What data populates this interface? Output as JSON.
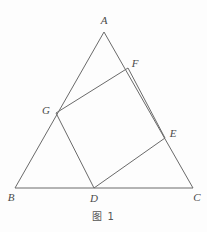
{
  "figure": {
    "caption": "图 1",
    "stroke_color": "#6a6a6a",
    "label_color": "#4a4a4a",
    "background_color": "#fdfdfd",
    "stroke_width": 1,
    "width": 207,
    "height": 232
  },
  "points": {
    "A": {
      "label": "A",
      "x": 104,
      "y": 32,
      "label_x": 104,
      "label_y": 20
    },
    "B": {
      "label": "B",
      "x": 15,
      "y": 188,
      "label_x": 11,
      "label_y": 197
    },
    "C": {
      "label": "C",
      "x": 193,
      "y": 188,
      "label_x": 197,
      "label_y": 197
    },
    "D": {
      "label": "D",
      "x": 94,
      "y": 188,
      "label_x": 94,
      "label_y": 198
    },
    "E": {
      "label": "E",
      "x": 165,
      "y": 138,
      "label_x": 173,
      "label_y": 133
    },
    "F": {
      "label": "F",
      "x": 128,
      "y": 68,
      "label_x": 135,
      "label_y": 63
    },
    "G": {
      "label": "G",
      "x": 56,
      "y": 113,
      "label_x": 46,
      "label_y": 110
    }
  },
  "shapes": {
    "triangle": {
      "name": "triangle-ABC",
      "vertices": "A,B,C",
      "path": "M 104,32 L 15,188 L 193,188 Z"
    },
    "square": {
      "name": "square-DEFG",
      "vertices": "G,F,E,D",
      "path": "M 56,113 L 128,68 L 165,138 L 94,188 Z"
    }
  }
}
